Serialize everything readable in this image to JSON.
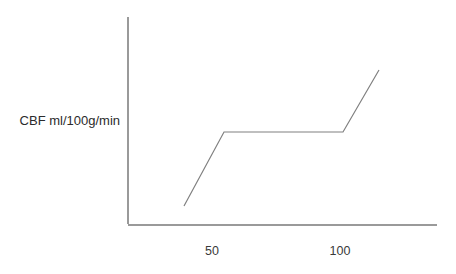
{
  "chart_data": {
    "type": "line",
    "title": "",
    "subtitle": "",
    "xlabel": "",
    "ylabel": "CBF ml/100g/min",
    "xlim": [
      20,
      140
    ],
    "ylim": [
      0,
      100
    ],
    "grid": false,
    "legend": null,
    "xticks": [
      50,
      100
    ],
    "xtick_labels": [
      "50",
      "100"
    ],
    "yticks": [],
    "ytick_labels": [],
    "annotations": [],
    "series": [
      {
        "name": "Cerebral blood flow autoregulation",
        "x": [
          38,
          53,
          100,
          114
        ],
        "y": [
          9,
          45,
          45,
          75
        ],
        "color": "#808080",
        "points_px": [
          {
            "x": 184,
            "y": 206
          },
          {
            "x": 224,
            "y": 132
          },
          {
            "x": 343,
            "y": 132
          },
          {
            "x": 379,
            "y": 70
          }
        ],
        "description": "Rising limb, flat autoregulatory plateau, then steep rising limb"
      }
    ],
    "axes": {
      "y_axis_px": {
        "x": 128,
        "y_top": 17,
        "y_bottom": 224
      },
      "x_axis_px": {
        "y": 225,
        "x_left": 128,
        "x_right": 437
      },
      "axis_color": "#9a9a9a"
    },
    "tick_positions_px": {
      "50": 212,
      "100": 340,
      "label_baseline_y": 255
    },
    "ylabel_px": {
      "x": 120,
      "y": 122
    }
  },
  "colors": {
    "background": "#ffffff",
    "axis": "#9a9a9a",
    "data_line": "#808080",
    "text": "#2b2b2b",
    "tick_text": "#3a3a3a"
  }
}
